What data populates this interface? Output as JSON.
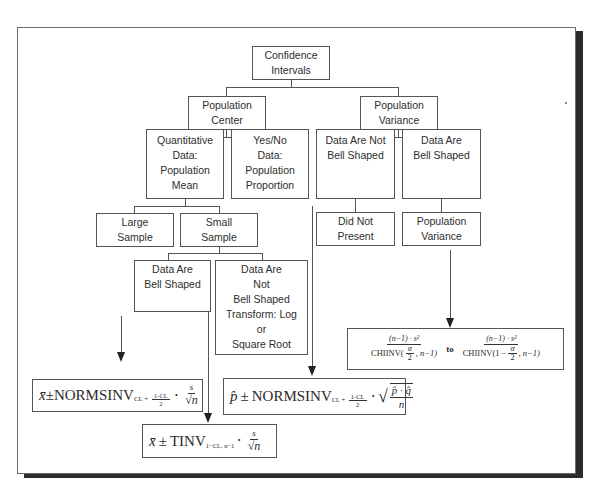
{
  "diagram": {
    "nodes": {
      "root": {
        "lines": [
          "Confidence",
          "Intervals"
        ]
      },
      "center": {
        "lines": [
          "Population",
          "Center"
        ]
      },
      "variance": {
        "lines": [
          "Population",
          "Variance"
        ]
      },
      "quant": {
        "lines": [
          "Quantitative",
          "Data:",
          "Population",
          "Mean"
        ]
      },
      "yesno": {
        "lines": [
          "Yes/No",
          "Data:",
          "Population",
          "Proportion"
        ]
      },
      "not_bell_var": {
        "lines": [
          "Data Are Not",
          "Bell Shaped"
        ]
      },
      "bell_var": {
        "lines": [
          "Data Are",
          "Bell Shaped"
        ]
      },
      "large": {
        "lines": [
          "Large",
          "Sample"
        ]
      },
      "small": {
        "lines": [
          "Small",
          "Sample"
        ]
      },
      "did_not": {
        "lines": [
          "Did Not",
          "Present"
        ]
      },
      "pop_var": {
        "lines": [
          "Population",
          "Variance"
        ]
      },
      "bell_small": {
        "lines": [
          "Data Are",
          "Bell Shaped"
        ]
      },
      "not_bell_small": {
        "lines": [
          "Data Are",
          "Not",
          "Bell Shaped",
          "Transform: Log",
          "or",
          "Square Root"
        ]
      }
    },
    "formulas": {
      "large_mean": {
        "xbar": "x̄",
        "pm": "±",
        "func": "NORMSINV",
        "sub_prefix": "CL +",
        "sub_num": "1-CL",
        "sub_den": "2",
        "dot": "·",
        "num": "s",
        "den": "√n"
      },
      "small_mean": {
        "xbar": "x̄",
        "pm": "±",
        "func": "TINV",
        "sub": "1−CL, n−1",
        "dot": "·",
        "num": "s",
        "den": "√n"
      },
      "proportion": {
        "phat": "p̂",
        "pm": "±",
        "func": "NORMSINV",
        "sub_prefix": "CL +",
        "sub_num": "1-CL",
        "sub_den": "2",
        "dot": "·",
        "num": "p̂ · q̂",
        "den": "n"
      },
      "variance": {
        "left_num": "(n−1) · s²",
        "left_den_pre": "CHIINV(",
        "left_alpha": "α",
        "left_two": "2",
        "left_den_post": ", n−1)",
        "to": "to",
        "right_num": "(n−1) · s²",
        "right_den_pre": "CHIINV(1 −",
        "right_alpha": "α",
        "right_two": "2",
        "right_den_post": ", n−1)"
      }
    }
  }
}
